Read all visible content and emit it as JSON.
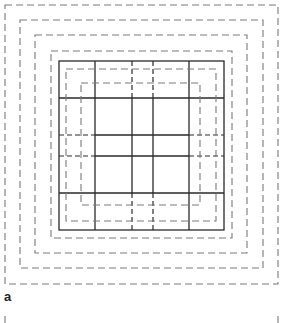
{
  "figure": {
    "panel_label": "a",
    "colors": {
      "dashed": "#7a7a7a",
      "solid": "#2a2a2a",
      "background": "#ffffff"
    },
    "outer_dashed_squares": [
      {
        "x1": 5,
        "y1": 5,
        "x2": 278,
        "y2": 284
      },
      {
        "x1": 20,
        "y1": 20,
        "x2": 263,
        "y2": 268
      },
      {
        "x1": 35,
        "y1": 35,
        "x2": 247,
        "y2": 253
      },
      {
        "x1": 51,
        "y1": 51,
        "x2": 232,
        "y2": 238
      }
    ],
    "solid_square": {
      "x1": 59,
      "y1": 61,
      "x2": 224,
      "y2": 230
    },
    "inner_dashed_squares": [
      {
        "x1": 66,
        "y1": 69,
        "x2": 216,
        "y2": 221
      },
      {
        "x1": 81,
        "y1": 83,
        "x2": 200,
        "y2": 205
      }
    ],
    "grid_columns": [
      95,
      132,
      153,
      189
    ],
    "grid_rows": [
      98,
      135,
      156,
      193
    ],
    "bottom_ticks": [
      {
        "x": 5,
        "y1": 316,
        "y2": 323
      },
      {
        "x": 278,
        "y1": 316,
        "y2": 323
      }
    ]
  }
}
